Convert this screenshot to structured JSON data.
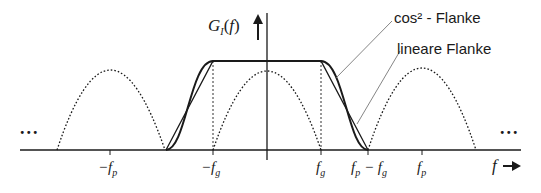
{
  "diagram": {
    "title": "",
    "y_axis_label": "G_I(f)",
    "y_axis_label_main": "G",
    "y_axis_label_sub": "I",
    "y_axis_label_arg": "(f)",
    "x_axis_label": "f",
    "annotations": {
      "cos2_flank": "cos² - Flanke",
      "linear_flank": "lineare Flanke"
    },
    "ellipsis_left": "...",
    "ellipsis_right": "...",
    "x_ticks": [
      {
        "label": "−f",
        "sub": "p",
        "x": 110
      },
      {
        "label": "−f",
        "sub": "g",
        "x": 213
      },
      {
        "label": "f",
        "sub": "g",
        "x": 321
      },
      {
        "label": "f",
        "sub": "p",
        "label2": " − f",
        "sub2": "g",
        "x": 368
      },
      {
        "label": "f",
        "sub": "p",
        "x": 422
      }
    ],
    "colors": {
      "line": "#1a1a1a",
      "leader": "#555555",
      "background": "#ffffff"
    }
  }
}
